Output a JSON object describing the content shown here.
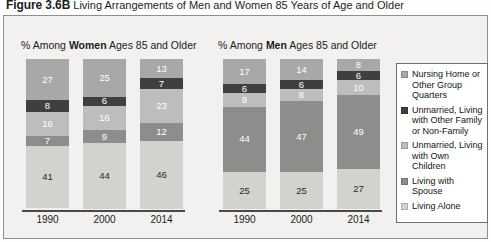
{
  "figure": {
    "number": "Figure 3.6B",
    "caption": "Living Arrangements of Men and Women 85 Years of Age and Older"
  },
  "panels": {
    "women": {
      "header_prefix": "% Among ",
      "header_emphasis": "Women",
      "header_suffix": " Ages 85 and Older"
    },
    "men": {
      "header_prefix": "% Among ",
      "header_emphasis": "Men",
      "header_suffix": " Ages 85 and Older"
    }
  },
  "legend": {
    "items": [
      {
        "label": "Nursing Home or Other Group Quarters",
        "color": "#a8a8a6"
      },
      {
        "label": "Unmarried, Living with Other Family or Non-Family",
        "color": "#3f3f3f"
      },
      {
        "label": "Unmarried, Living with Own Children",
        "color": "#bdbdbb"
      },
      {
        "label": "Living with Spouse",
        "color": "#8d8d8b"
      },
      {
        "label": "Living Alone",
        "color": "#d2d2cf"
      }
    ]
  },
  "chart_data": [
    {
      "type": "bar",
      "stacked": true,
      "title": "% Among Women Ages 85 and Older",
      "xlabel": "",
      "ylabel": "Percent",
      "ylim": [
        0,
        100
      ],
      "grid": false,
      "legend_position": "right",
      "categories": [
        "1990",
        "2000",
        "2014"
      ],
      "series": [
        {
          "name": "Nursing Home or Other Group Quarters",
          "color": "#a8a8a6",
          "values": [
            27,
            25,
            13
          ]
        },
        {
          "name": "Unmarried, Living with Other Family or Non-Family",
          "color": "#3f3f3f",
          "values": [
            8,
            6,
            7
          ]
        },
        {
          "name": "Unmarried, Living with Own Children",
          "color": "#bdbdbb",
          "values": [
            16,
            16,
            23
          ]
        },
        {
          "name": "Living with Spouse",
          "color": "#8d8d8b",
          "values": [
            7,
            9,
            12
          ]
        },
        {
          "name": "Living Alone",
          "color": "#d2d2cf",
          "values": [
            41,
            44,
            46
          ]
        }
      ]
    },
    {
      "type": "bar",
      "stacked": true,
      "title": "% Among Men Ages 85 and Older",
      "xlabel": "",
      "ylabel": "Percent",
      "ylim": [
        0,
        100
      ],
      "grid": false,
      "legend_position": "right",
      "categories": [
        "1990",
        "2000",
        "2014"
      ],
      "series": [
        {
          "name": "Nursing Home or Other Group Quarters",
          "color": "#a8a8a6",
          "values": [
            17,
            14,
            8
          ]
        },
        {
          "name": "Unmarried, Living with Other Family or Non-Family",
          "color": "#3f3f3f",
          "values": [
            6,
            6,
            6
          ]
        },
        {
          "name": "Unmarried, Living with Own Children",
          "color": "#bdbdbb",
          "values": [
            9,
            8,
            10
          ]
        },
        {
          "name": "Living with Spouse",
          "color": "#8d8d8b",
          "values": [
            44,
            47,
            49
          ]
        },
        {
          "name": "Living Alone",
          "color": "#d2d2cf",
          "values": [
            25,
            25,
            27
          ]
        }
      ]
    }
  ]
}
